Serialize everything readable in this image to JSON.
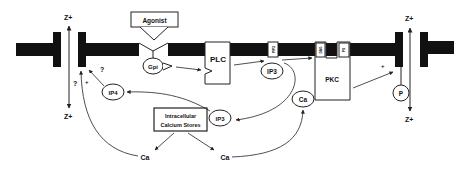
{
  "diagram": {
    "title": "",
    "colors": {
      "membrane": "#111111",
      "line": "#222222",
      "background": "#ffffff"
    },
    "labels": {
      "agonist": "Agonist",
      "gpi": "Gpi",
      "plc": "PLC",
      "pip2": "PIP2",
      "ip3_membrane": "IP3",
      "dag": "DAG",
      "ps": "PS",
      "pkc": "PKC",
      "ca_pkc": "Ca",
      "p": "P",
      "ip4": "IP4",
      "stores_line1": "Intracellular",
      "stores_line2": "Calcium Stores",
      "ip3_cytosol": "IP3",
      "ca_left": "Ca",
      "ca_right": "Ca",
      "z_left_top": "Z+",
      "z_left_bottom": "Z+",
      "z_right_top": "Z+",
      "z_right_bottom": "Z+",
      "q_ip4": "?",
      "q_channel": "?",
      "plus_ca_left": "+",
      "plus_pkc": "+"
    },
    "nodes": [
      {
        "id": "agonist",
        "label": "Agonist",
        "shape": "box"
      },
      {
        "id": "gpi",
        "label": "Gpi",
        "shape": "ellipse"
      },
      {
        "id": "plc",
        "label": "PLC",
        "shape": "box"
      },
      {
        "id": "pip2",
        "label": "PIP2",
        "shape": "membrane-box"
      },
      {
        "id": "ip3_m",
        "label": "IP3",
        "shape": "ellipse"
      },
      {
        "id": "dag",
        "label": "DAG",
        "shape": "membrane-box"
      },
      {
        "id": "ps",
        "label": "PS",
        "shape": "membrane-box"
      },
      {
        "id": "pkc",
        "label": "PKC",
        "shape": "box"
      },
      {
        "id": "ca_pkc",
        "label": "Ca",
        "shape": "ellipse"
      },
      {
        "id": "p",
        "label": "P",
        "shape": "ellipse"
      },
      {
        "id": "ip4",
        "label": "IP4",
        "shape": "ellipse"
      },
      {
        "id": "stores",
        "label": "Intracellular Calcium Stores",
        "shape": "box"
      },
      {
        "id": "ip3_c",
        "label": "IP3",
        "shape": "ellipse"
      },
      {
        "id": "ca_l",
        "label": "Ca",
        "shape": "text"
      },
      {
        "id": "ca_r",
        "label": "Ca",
        "shape": "text"
      }
    ],
    "edges": [
      {
        "from": "gpi",
        "to": "plc"
      },
      {
        "from": "plc",
        "to": "pip2"
      },
      {
        "from": "pip2",
        "to": "dag"
      },
      {
        "from": "ip3_m",
        "to": "ip3_c"
      },
      {
        "from": "ip3_c",
        "to": "ip4"
      },
      {
        "from": "ip4",
        "to": "left_channel",
        "label": "?"
      },
      {
        "from": "stores",
        "to": "ca_l"
      },
      {
        "from": "stores",
        "to": "ca_r"
      },
      {
        "from": "ca_l",
        "to": "left_channel",
        "label": "+"
      },
      {
        "from": "ca_r",
        "to": "ca_pkc"
      },
      {
        "from": "pkc",
        "to": "right_channel",
        "label": "+"
      }
    ]
  }
}
